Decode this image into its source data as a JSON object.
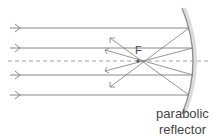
{
  "diagram": {
    "title": "",
    "focus_label": "F",
    "reflector_label_line1": "parabolic",
    "reflector_label_line2": "reflector",
    "colors": {
      "ray": "#7a7a7a",
      "axis": "#9a9a9a",
      "reflector": "#9c9c9c",
      "reflector_shadow": "#d8d8d8",
      "text": "#444444"
    },
    "incoming_rays_y": [
      28,
      48,
      75,
      95
    ],
    "optical_axis_y": 61,
    "focus": {
      "x": 138,
      "y": 61
    }
  }
}
